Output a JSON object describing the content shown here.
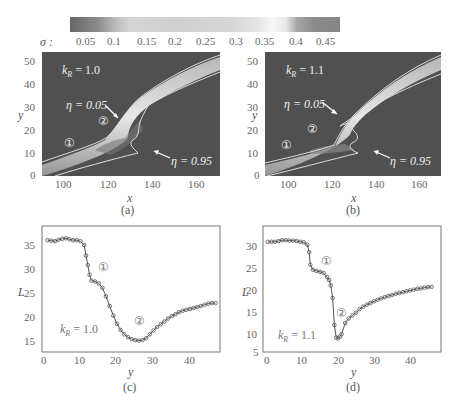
{
  "colorbar": {
    "label": "σ :",
    "ticks": [
      "0.05",
      "0.1",
      "0.15",
      "0.2",
      "0.25",
      "0.3",
      "0.35",
      "0.4",
      "0.45"
    ]
  },
  "panels": {
    "a": {
      "caption": "(a)",
      "k_label": "k",
      "k_sub": "R",
      "k_value": "= 1.0",
      "eta1": "η = 0.05",
      "eta2": "η = 0.95",
      "m1": "①",
      "m2": "②",
      "xlabel": "x",
      "ylabel": "y"
    },
    "b": {
      "caption": "(b)",
      "k_label": "k",
      "k_sub": "R",
      "k_value": "= 1.1",
      "eta1": "η = 0.05",
      "eta2": "η = 0.95",
      "m1": "①",
      "m2": "②",
      "xlabel": "x",
      "ylabel": "y"
    },
    "c": {
      "caption": "(c)",
      "k_label": "k",
      "k_sub": "R",
      "k_value": "= 1.0",
      "m1": "①",
      "m2": "②",
      "xlabel": "y",
      "ylabel": "L"
    },
    "d": {
      "caption": "(d)",
      "k_label": "k",
      "k_sub": "R",
      "k_value": "= 1.1",
      "m1": "①",
      "m2": "②",
      "xlabel": "y",
      "ylabel": "L"
    }
  },
  "chart_data": [
    {
      "type": "heatmap",
      "panel": "a",
      "title": "k_R = 1.0",
      "xlabel": "x",
      "ylabel": "y",
      "xticks": [
        100,
        120,
        140,
        160
      ],
      "yticks": [
        0,
        10,
        20,
        30,
        40,
        50
      ],
      "xlim": [
        90,
        170
      ],
      "ylim": [
        0,
        55
      ],
      "colorbar": {
        "label": "σ",
        "ticks": [
          0.05,
          0.1,
          0.15,
          0.2,
          0.25,
          0.3,
          0.35,
          0.4,
          0.45
        ]
      },
      "annotations": [
        "η = 0.05",
        "η = 0.95",
        "①",
        "②"
      ]
    },
    {
      "type": "heatmap",
      "panel": "b",
      "title": "k_R = 1.1",
      "xlabel": "x",
      "ylabel": "y",
      "xticks": [
        100,
        120,
        140,
        160
      ],
      "yticks": [
        0,
        10,
        20,
        30,
        40,
        50
      ],
      "xlim": [
        90,
        170
      ],
      "ylim": [
        0,
        55
      ],
      "annotations": [
        "η = 0.05",
        "η = 0.95",
        "①",
        "②"
      ]
    },
    {
      "type": "line",
      "panel": "c",
      "title": "k_R = 1.0",
      "xlabel": "y",
      "ylabel": "L",
      "xticks": [
        0,
        10,
        20,
        30,
        40
      ],
      "yticks": [
        15,
        20,
        25,
        30,
        35
      ],
      "xlim": [
        -1,
        48
      ],
      "ylim": [
        13,
        38
      ],
      "x": [
        1,
        2,
        3,
        4,
        5,
        6,
        7,
        8,
        9,
        10,
        11,
        11.5,
        12,
        12.5,
        13,
        14,
        15,
        16,
        17,
        18,
        19,
        20,
        21,
        22,
        23,
        24,
        25,
        26,
        27,
        28,
        29,
        30,
        31,
        32,
        33,
        34,
        35,
        36,
        37,
        38,
        39,
        40,
        41,
        42,
        43,
        44,
        45,
        46,
        47
      ],
      "values": [
        36.2,
        36.1,
        36.0,
        36.3,
        36.5,
        36.6,
        36.4,
        36.2,
        36.2,
        36.0,
        35.2,
        33,
        31,
        29,
        27.8,
        27.6,
        27.2,
        26.3,
        24.5,
        22.5,
        20.5,
        18.8,
        17.5,
        16.6,
        16.0,
        15.6,
        15.4,
        15.3,
        15.4,
        15.8,
        16.6,
        17.4,
        18.1,
        18.7,
        19.3,
        19.9,
        20.4,
        20.8,
        21.2,
        21.5,
        21.7,
        21.9,
        22.1,
        22.3,
        22.5,
        22.8,
        23.0,
        23.1,
        23.1
      ]
    },
    {
      "type": "line",
      "panel": "d",
      "title": "k_R = 1.1",
      "xlabel": "y",
      "ylabel": "L",
      "xticks": [
        0,
        10,
        20,
        30,
        40
      ],
      "yticks": [
        5,
        10,
        15,
        20,
        25,
        30
      ],
      "xlim": [
        -1,
        48
      ],
      "ylim": [
        4.5,
        33
      ],
      "x": [
        0.5,
        1.5,
        2.5,
        3.5,
        4.5,
        5.5,
        6.5,
        7.5,
        8.5,
        9.5,
        10.5,
        11.5,
        12,
        12.3,
        13,
        14,
        15,
        16,
        17,
        17.5,
        18,
        18.5,
        19,
        19.5,
        20,
        20.5,
        21,
        22,
        23,
        24,
        25,
        26,
        27,
        28,
        29,
        30,
        31,
        32,
        33,
        34,
        35,
        36,
        37,
        38,
        39,
        40,
        41,
        42,
        43,
        44,
        45,
        46
      ],
      "values": [
        31.0,
        31.0,
        31.0,
        31.2,
        31.4,
        31.4,
        31.3,
        31.3,
        31.2,
        31.0,
        30.9,
        30.3,
        28.5,
        25.5,
        24.3,
        24.0,
        23.8,
        23.5,
        22.5,
        21.8,
        20.5,
        17.5,
        11.0,
        8.0,
        7.8,
        8.2,
        8.8,
        11.5,
        12.6,
        13.3,
        14.0,
        14.8,
        15.4,
        15.9,
        16.3,
        16.7,
        17.1,
        17.4,
        17.7,
        18.0,
        18.2,
        18.5,
        18.7,
        18.9,
        19.1,
        19.3,
        19.5,
        19.7,
        19.8,
        20.0,
        20.1,
        20.2
      ]
    }
  ]
}
